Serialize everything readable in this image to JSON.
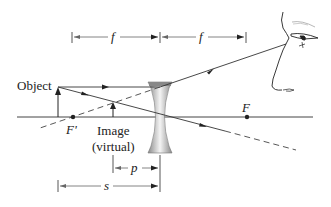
{
  "diagram": {
    "labels": {
      "object": "Object",
      "image_line1": "Image",
      "image_line2": "(virtual)",
      "focal_left": "F'",
      "focal_right": "F",
      "f_left": "f",
      "f_right": "f",
      "p": "p",
      "s": "s"
    },
    "colors": {
      "line": "#333333",
      "dashed": "#444444",
      "lens_dark": "#777777",
      "lens_light": "#f2f2f2"
    }
  }
}
